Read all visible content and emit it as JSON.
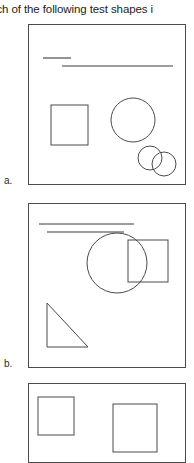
{
  "document": {
    "question_text": "ich of the following test shapes i",
    "background_color": "#ffffff",
    "ink_color": "#4a4a4a"
  },
  "choices": [
    {
      "id": "a",
      "label": "a.",
      "box": {
        "x": 28,
        "y": 24,
        "width": 158,
        "height": 161
      },
      "shapes": [
        {
          "name": "short-rule",
          "type": "line",
          "x1": 43,
          "y1": 58,
          "x2": 71,
          "y2": 58
        },
        {
          "name": "long-rule",
          "type": "line",
          "x1": 62,
          "y1": 66,
          "x2": 173,
          "y2": 66
        },
        {
          "name": "square",
          "type": "rect",
          "x": 51,
          "y": 105,
          "width": 37,
          "height": 40
        },
        {
          "name": "large-circle",
          "type": "circle",
          "cx": 133,
          "cy": 120,
          "r": 22
        },
        {
          "name": "small-circle-left",
          "type": "circle",
          "cx": 150,
          "cy": 158,
          "r": 12
        },
        {
          "name": "small-circle-right",
          "type": "circle",
          "cx": 164,
          "cy": 164,
          "r": 12
        }
      ]
    },
    {
      "id": "b",
      "label": "b.",
      "box": {
        "x": 28,
        "y": 203,
        "width": 158,
        "height": 165
      },
      "shapes": [
        {
          "name": "upper-rule",
          "type": "line",
          "x1": 39,
          "y1": 224,
          "x2": 134,
          "y2": 224
        },
        {
          "name": "lower-rule",
          "type": "line",
          "x1": 47,
          "y1": 232,
          "x2": 124,
          "y2": 232
        },
        {
          "name": "square",
          "type": "rect",
          "x": 128,
          "y": 240,
          "width": 40,
          "height": 42
        },
        {
          "name": "circle",
          "type": "circle",
          "cx": 117,
          "cy": 263,
          "r": 30
        },
        {
          "name": "right-triangle",
          "type": "polygon",
          "points": "47,303 47,347 88,347"
        }
      ]
    },
    {
      "id": "c",
      "label": "",
      "box": {
        "x": 28,
        "y": 383,
        "width": 158,
        "height": 80
      },
      "shapes": [
        {
          "name": "small-square",
          "type": "rect",
          "x": 38,
          "y": 397,
          "width": 36,
          "height": 38
        },
        {
          "name": "large-square",
          "type": "rect",
          "x": 113,
          "y": 404,
          "width": 44,
          "height": 48
        }
      ]
    }
  ]
}
